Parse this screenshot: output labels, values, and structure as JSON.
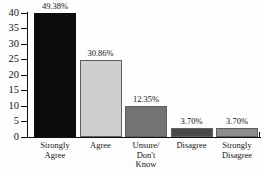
{
  "chart_data": {
    "type": "bar",
    "title": "",
    "subtitle": "",
    "xlabel": "",
    "ylabel": "",
    "ylim": [
      0,
      40
    ],
    "grid": false,
    "legend": "none",
    "categories": [
      "Strongly Agree",
      "Agree",
      "Unsure/ Don't Know",
      "Disagree",
      "Strongly Disagree"
    ],
    "category_lines": [
      [
        "Strongly",
        "Agree"
      ],
      [
        "Agree"
      ],
      [
        "Unsure/",
        "Don't",
        "Know"
      ],
      [
        "Disagree"
      ],
      [
        "Strongly",
        "Disagree"
      ]
    ],
    "values": [
      40,
      25,
      10,
      3,
      3
    ],
    "data_labels": [
      "49.38%",
      "30.86%",
      "12.35%",
      "3.70%",
      "3.70%"
    ],
    "bar_colors": [
      "#0c0c0c",
      "#cfcfcf",
      "#737373",
      "#4a4a4a",
      "#8e8e8e"
    ],
    "y_ticks": [
      0,
      5,
      10,
      15,
      20,
      25,
      30,
      35,
      40
    ],
    "y_tick_labels": [
      "0",
      "5",
      "10",
      "15",
      "20",
      "25",
      "30",
      "35",
      "40"
    ]
  }
}
